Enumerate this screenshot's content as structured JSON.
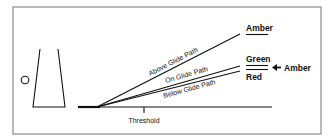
{
  "diagram": {
    "type": "glide-path-indicator",
    "paths": [
      {
        "label": "Above Glide Path",
        "indication": "Amber"
      },
      {
        "label": "On Glide Path",
        "indication": "Green"
      },
      {
        "label": "Below Glide Path",
        "indication": "Red"
      }
    ],
    "labels": {
      "above": "Above Glide Path",
      "on": "On Glide Path",
      "below": "Below Glide Path",
      "threshold": "Threshold",
      "amber_top": "Amber",
      "green": "Green",
      "red": "Red",
      "amber_side": "Amber"
    },
    "colors": {
      "line": "#111111",
      "frame": "#777777",
      "background": "#ffffff"
    }
  }
}
